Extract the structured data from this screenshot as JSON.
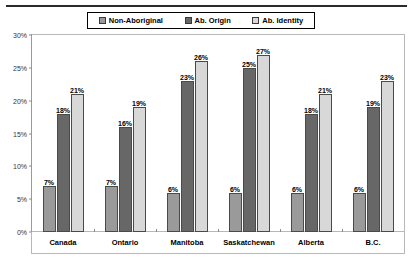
{
  "chart_data": {
    "type": "bar",
    "title": "",
    "xlabel": "",
    "ylabel": "",
    "ylim": [
      0,
      30
    ],
    "ytick_labels": [
      "0%",
      "5%",
      "10%",
      "15%",
      "20%",
      "25%",
      "30%"
    ],
    "ytick_values": [
      0,
      5,
      10,
      15,
      20,
      25,
      30
    ],
    "grid": false,
    "legend_position": "top",
    "categories": [
      "Canada",
      "Ontario",
      "Manitoba",
      "Saskatchewan",
      "Alberta",
      "B.C."
    ],
    "series": [
      {
        "name": "Non-Aboriginal",
        "color": "#9a9a9a",
        "values": [
          7,
          7,
          6,
          6,
          6,
          6
        ],
        "labels": [
          "7%",
          "7%",
          "6%",
          "6%",
          "6%",
          "6%"
        ]
      },
      {
        "name": "Ab. Origin",
        "color": "#676767",
        "values": [
          18,
          16,
          23,
          25,
          18,
          19
        ],
        "labels": [
          "18%",
          "16%",
          "23%",
          "25%",
          "18%",
          "19%"
        ]
      },
      {
        "name": "Ab. Identity",
        "color": "#d8d8d8",
        "values": [
          21,
          19,
          26,
          27,
          21,
          23
        ],
        "labels": [
          "21%",
          "19%",
          "26%",
          "27%",
          "21%",
          "23%"
        ]
      }
    ]
  },
  "legend": {
    "items": [
      {
        "label": "Non-Aboriginal",
        "swatch": "swatch-non-aboriginal"
      },
      {
        "label": "Ab. Origin",
        "swatch": "swatch-ab-origin"
      },
      {
        "label": "Ab. Identity",
        "swatch": "swatch-ab-identity"
      }
    ]
  }
}
